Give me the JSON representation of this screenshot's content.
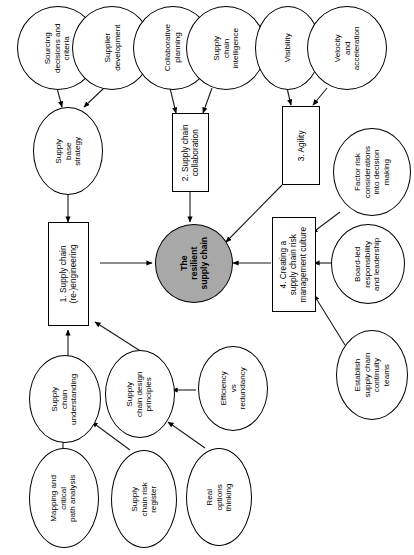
{
  "diagram": {
    "title": "The resilient supply chain",
    "orientation": "rotated-90-ccw",
    "colors": {
      "core_fill": "#a8a8a8",
      "node_fill": "#ffffff",
      "stroke": "#000000",
      "background": "#ffffff"
    },
    "core": {
      "id": "core",
      "shape": "ellipse",
      "label": "The resilient supply chain",
      "lines": [
        "The",
        "resilient",
        "supply chain"
      ]
    },
    "pillars": [
      {
        "id": "pillar-1",
        "shape": "rectangle",
        "label": "1. Supply chain (re-)engineering",
        "lines": [
          "1. Supply chain",
          "(re-)engineering"
        ]
      },
      {
        "id": "pillar-2",
        "shape": "rectangle",
        "label": "2. Supply chain collaboration",
        "lines": [
          "2. Supply chain",
          "collaboration"
        ]
      },
      {
        "id": "pillar-3",
        "shape": "rectangle",
        "label": "3. Agility",
        "lines": [
          "3. Agility"
        ]
      },
      {
        "id": "pillar-4",
        "shape": "rectangle",
        "label": "4. Creating a supply chain risk management culture",
        "lines": [
          "4. Creating a",
          "supply chain risk",
          "management culture"
        ]
      }
    ],
    "nodes": [
      {
        "id": "sourcing-decisions",
        "shape": "ellipse",
        "label": "Sourcing decisions and criteria",
        "lines": [
          "Sourcing",
          "decisions and",
          "criteria"
        ]
      },
      {
        "id": "supplier-development",
        "shape": "ellipse",
        "label": "Supplier development",
        "lines": [
          "Supplier",
          "development"
        ]
      },
      {
        "id": "supply-base-strategy",
        "shape": "ellipse",
        "label": "Supply base strategy",
        "lines": [
          "Supply",
          "base",
          "strategy"
        ]
      },
      {
        "id": "collaborative-planning",
        "shape": "ellipse",
        "label": "Collaborative planning",
        "lines": [
          "Collaborative",
          "planning"
        ]
      },
      {
        "id": "supply-chain-intelligence",
        "shape": "ellipse",
        "label": "Supply chain intelligence",
        "lines": [
          "Supply",
          "chain",
          "intelligence"
        ]
      },
      {
        "id": "visibility",
        "shape": "ellipse",
        "label": "Visibility",
        "lines": [
          "Visibility"
        ]
      },
      {
        "id": "velocity-acceleration",
        "shape": "ellipse",
        "label": "Velocity and acceleration",
        "lines": [
          "Velocity",
          "and",
          "acceleration"
        ]
      },
      {
        "id": "factor-risk",
        "shape": "ellipse",
        "label": "Factor risk considerations into decision making",
        "lines": [
          "Factor risk",
          "considerations",
          "into decision",
          "making"
        ]
      },
      {
        "id": "board-led",
        "shape": "ellipse",
        "label": "Board-led responsibility and leadership",
        "lines": [
          "Board-led",
          "responsibility",
          "and leadership"
        ]
      },
      {
        "id": "establish-teams",
        "shape": "ellipse",
        "label": "Establish supply chain continuity teams",
        "lines": [
          "Establish",
          "supply chain",
          "continuity",
          "teams"
        ]
      },
      {
        "id": "supply-chain-understanding",
        "shape": "ellipse",
        "label": "Supply chain understanding",
        "lines": [
          "Supply",
          "chain",
          "understanding"
        ]
      },
      {
        "id": "supply-chain-design-principles",
        "shape": "ellipse",
        "label": "Supply chain design principles",
        "lines": [
          "Supply",
          "chain design",
          "principles"
        ]
      },
      {
        "id": "efficiency-vs-redundancy",
        "shape": "ellipse",
        "label": "Efficiency vs redundancy",
        "lines": [
          "Efficiency",
          "vs",
          "redundancy"
        ]
      },
      {
        "id": "mapping-critical-path",
        "shape": "ellipse",
        "label": "Mapping and critical path analysis",
        "lines": [
          "Mapping and",
          "critical",
          "path analysis"
        ]
      },
      {
        "id": "supply-chain-risk-register",
        "shape": "ellipse",
        "label": "Supply chain risk register",
        "lines": [
          "Supply",
          "chain risk",
          "register"
        ]
      },
      {
        "id": "real-options-thinking",
        "shape": "ellipse",
        "label": "Real options thinking",
        "lines": [
          "Real",
          "options",
          "thinking"
        ]
      }
    ],
    "edges": [
      {
        "from": "sourcing-decisions",
        "to": "supply-base-strategy"
      },
      {
        "from": "supplier-development",
        "to": "supply-base-strategy"
      },
      {
        "from": "supply-base-strategy",
        "to": "pillar-1"
      },
      {
        "from": "collaborative-planning",
        "to": "pillar-2"
      },
      {
        "from": "supply-chain-intelligence",
        "to": "pillar-2"
      },
      {
        "from": "visibility",
        "to": "pillar-3"
      },
      {
        "from": "velocity-acceleration",
        "to": "pillar-3"
      },
      {
        "from": "pillar-1",
        "to": "core"
      },
      {
        "from": "pillar-2",
        "to": "core"
      },
      {
        "from": "pillar-3",
        "to": "core"
      },
      {
        "from": "pillar-4",
        "to": "core"
      },
      {
        "from": "factor-risk",
        "to": "pillar-4"
      },
      {
        "from": "board-led",
        "to": "pillar-4"
      },
      {
        "from": "establish-teams",
        "to": "pillar-4"
      },
      {
        "from": "supply-chain-understanding",
        "to": "pillar-1"
      },
      {
        "from": "supply-chain-design-principles",
        "to": "pillar-1"
      },
      {
        "from": "mapping-critical-path",
        "to": "supply-chain-understanding"
      },
      {
        "from": "supply-chain-risk-register",
        "to": "supply-chain-understanding"
      },
      {
        "from": "efficiency-vs-redundancy",
        "to": "supply-chain-design-principles"
      },
      {
        "from": "real-options-thinking",
        "to": "supply-chain-design-principles"
      }
    ]
  }
}
